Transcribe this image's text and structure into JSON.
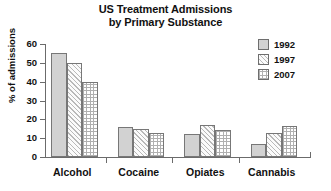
{
  "chart_data": {
    "type": "bar",
    "title": "US Treatment Admissions by Primary Substance",
    "title_lines": [
      "US Treatment Admissions",
      "by Primary Substance"
    ],
    "xlabel": "",
    "ylabel": "% of admissions",
    "categories": [
      "Alcohol",
      "Cocaine",
      "Opiates",
      "Cannabis"
    ],
    "series": [
      {
        "name": "1992",
        "values": [
          55,
          16,
          12,
          7
        ],
        "pattern": "solid",
        "color": "#d2d2d2"
      },
      {
        "name": "1997",
        "values": [
          50,
          15,
          17,
          13
        ],
        "pattern": "hatch",
        "color": "#fbfbfb"
      },
      {
        "name": "2007",
        "values": [
          40,
          13,
          14.5,
          16.5
        ],
        "pattern": "check",
        "color": "#ffffff"
      }
    ],
    "ylim": [
      0,
      60
    ],
    "yticks": [
      0,
      10,
      20,
      30,
      40,
      50,
      60
    ],
    "ytick_labels": [
      "0",
      "10",
      "20",
      "30",
      "40",
      "50",
      "60"
    ],
    "grid": false,
    "legend_position": "top-right",
    "legend": [
      "1992",
      "1997",
      "2007"
    ]
  }
}
